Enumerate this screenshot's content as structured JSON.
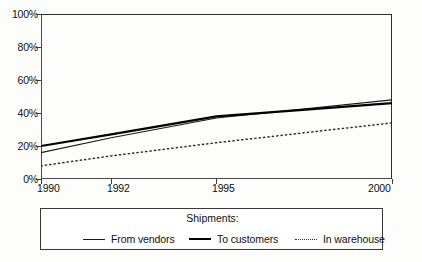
{
  "chart_data": {
    "type": "line",
    "title": "",
    "xlabel": "",
    "ylabel": "",
    "xlim": [
      1990,
      2000
    ],
    "ylim": [
      0,
      100
    ],
    "grid": false,
    "legend_position": "bottom",
    "legend_title": "Shipments:",
    "y_ticks": [
      {
        "value": 0,
        "label": "0%"
      },
      {
        "value": 20,
        "label": "20%"
      },
      {
        "value": 40,
        "label": "40%"
      },
      {
        "value": 60,
        "label": "60%"
      },
      {
        "value": 80,
        "label": "80%"
      },
      {
        "value": 100,
        "label": "100%"
      }
    ],
    "x_ticks": [
      {
        "value": 1990,
        "label": "1990"
      },
      {
        "value": 1992,
        "label": "1992"
      },
      {
        "value": 1995,
        "label": "1995"
      },
      {
        "value": 2000,
        "label": "2000"
      }
    ],
    "x": [
      1990,
      1992,
      1995,
      2000
    ],
    "series": [
      {
        "name": "From vendors",
        "style": "thin-solid",
        "color": "#1a1a1a",
        "values": [
          16,
          25,
          37,
          48
        ]
      },
      {
        "name": "To customers",
        "style": "thick-solid",
        "color": "#000000",
        "values": [
          20,
          27,
          38,
          46
        ]
      },
      {
        "name": "In warehouse",
        "style": "dotted",
        "color": "#2f2f2f",
        "values": [
          8,
          14,
          22,
          34
        ]
      }
    ]
  },
  "legend": {
    "title": "Shipments:",
    "items": [
      {
        "label": "From vendors",
        "swatch": "thin-line-swatch"
      },
      {
        "label": "To customers",
        "swatch": "thick-line-swatch"
      },
      {
        "label": "In warehouse",
        "swatch": "dotted-line-swatch"
      }
    ]
  },
  "axes": {
    "y_labels": [
      "100%",
      "80%",
      "60%",
      "40%",
      "20%",
      "0%"
    ],
    "x_labels": [
      "1990",
      "1992",
      "1995",
      "2000"
    ]
  }
}
